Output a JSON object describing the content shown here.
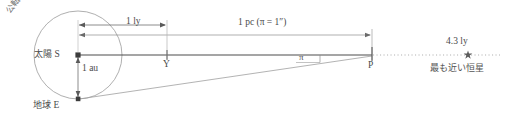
{
  "diagram": {
    "labels": {
      "orbit": "公転軌道",
      "sun_jp": "太陽",
      "sun_point": "S",
      "earth_jp": "地球",
      "earth_point": "E",
      "au_distance": "1 au",
      "ly_distance": "1 ly",
      "pc_distance": "1 pc (π = 1″)",
      "point_y": "Y",
      "point_p": "P",
      "parallax_angle": "π",
      "star_distance": "4.3 ly",
      "nearest_star_jp": "最も近い恒星"
    },
    "geometry": {
      "sun_x": 78,
      "sun_y": 55,
      "earth_x": 78,
      "earth_y": 99,
      "point_y_x": 167,
      "point_p_x": 372,
      "star_x": 468,
      "orbit_center_x": 78,
      "orbit_center_y": 55,
      "orbit_radius_x": 44,
      "orbit_radius_y": 44,
      "ly_arrow_y": 25,
      "pc_arrow_y": 35,
      "dotted_end_x": 500
    },
    "colors": {
      "line": "#6e6e6e",
      "baseline": "#4d4d4d",
      "thin": "#9a9a9a",
      "dotted": "#a8a8a8",
      "text": "#4a4a4a",
      "background": "#ffffff"
    }
  }
}
